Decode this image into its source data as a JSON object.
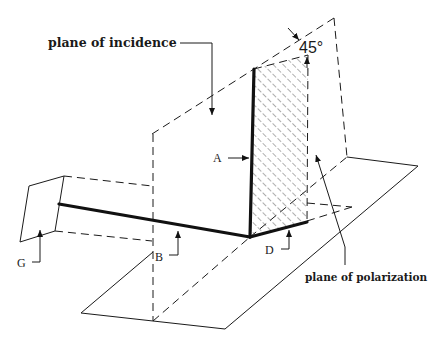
{
  "figure": {
    "labels": {
      "plane_of_incidence": "plane of incidence",
      "plane_of_polarization": "plane of polarization",
      "angle": "45°",
      "A": "A",
      "B": "B",
      "D": "D",
      "G": "G"
    },
    "colors": {
      "ink": "#1a1a1a",
      "background": "#ffffff"
    }
  }
}
